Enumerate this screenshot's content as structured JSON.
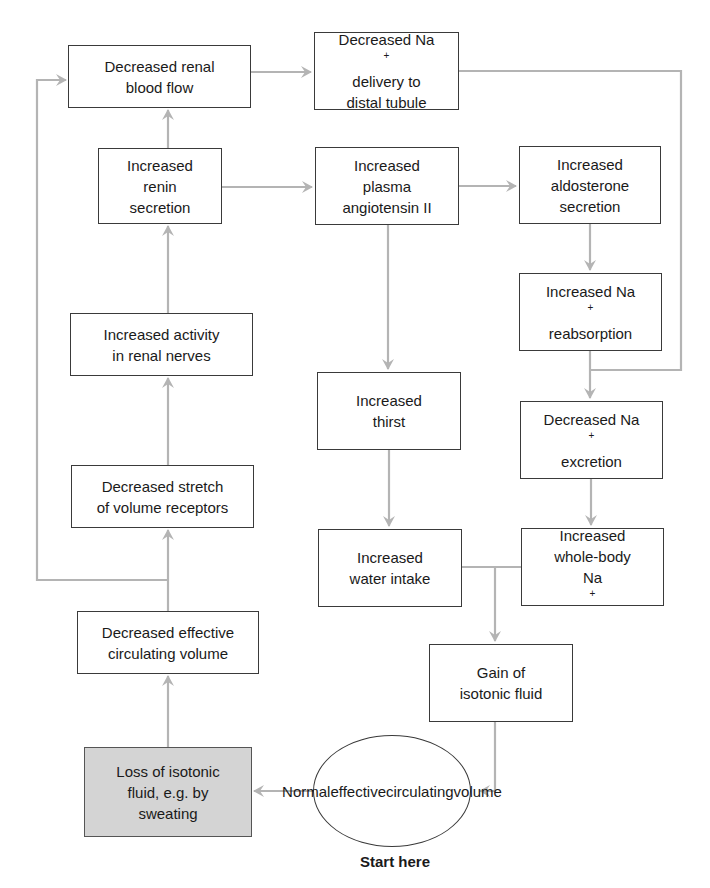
{
  "diagram": {
    "start_label": "Start here",
    "colors": {
      "arrow": "#b4b4b4",
      "border": "#3a3a3a",
      "shaded_box": "#d4d4d4"
    },
    "nodes": {
      "renal_blood_flow": {
        "line1": "Decreased renal",
        "line2": "blood flow"
      },
      "na_delivery": {
        "line1": "Decreased Na",
        "sup1": "+",
        "line2": "delivery to",
        "line3": "distal tubule"
      },
      "renin": {
        "line1": "Increased",
        "line2": "renin",
        "line3": "secretion"
      },
      "angiotensin": {
        "line1": "Increased",
        "line2": "plasma",
        "line3": "angiotensin II"
      },
      "aldosterone": {
        "line1": "Increased",
        "line2": "aldosterone",
        "line3": "secretion"
      },
      "renal_nerves": {
        "line1": "Increased activity",
        "line2": "in renal nerves"
      },
      "na_reabsorption": {
        "line1": "Increased Na",
        "sup1": "+",
        "line2": "reabsorption"
      },
      "thirst": {
        "line1": "Increased",
        "line2": "thirst"
      },
      "na_excretion": {
        "line1": "Decreased Na",
        "sup1": "+",
        "line2": "excretion"
      },
      "volume_receptors": {
        "line1": "Decreased stretch",
        "line2": "of volume receptors"
      },
      "water_intake": {
        "line1": "Increased",
        "line2": "water intake"
      },
      "whole_body_na": {
        "line1": "Increased",
        "line2": "whole-body",
        "line3": "Na",
        "sup3": "+"
      },
      "effective_volume_decreased": {
        "line1": "Decreased effective",
        "line2": "circulating volume"
      },
      "gain_fluid": {
        "line1": "Gain of",
        "line2": "isotonic fluid"
      },
      "loss_fluid": {
        "line1": "Loss of isotonic",
        "line2": "fluid, e.g. by",
        "line3": "sweating"
      },
      "normal_volume": {
        "line1": "Normal",
        "line2": "effective",
        "line3": "circulating",
        "line4": "volume"
      }
    },
    "edges": [
      [
        "normal_volume",
        "loss_fluid"
      ],
      [
        "loss_fluid",
        "effective_volume_decreased"
      ],
      [
        "effective_volume_decreased",
        "volume_receptors"
      ],
      [
        "effective_volume_decreased",
        "renal_blood_flow"
      ],
      [
        "volume_receptors",
        "renal_nerves"
      ],
      [
        "renal_nerves",
        "renin"
      ],
      [
        "renin",
        "renal_blood_flow"
      ],
      [
        "renin",
        "angiotensin"
      ],
      [
        "renal_blood_flow",
        "na_delivery"
      ],
      [
        "angiotensin",
        "aldosterone"
      ],
      [
        "angiotensin",
        "thirst"
      ],
      [
        "aldosterone",
        "na_reabsorption"
      ],
      [
        "na_reabsorption",
        "na_excretion"
      ],
      [
        "na_delivery",
        "na_excretion"
      ],
      [
        "na_excretion",
        "whole_body_na"
      ],
      [
        "thirst",
        "water_intake"
      ],
      [
        "water_intake",
        "gain_fluid"
      ],
      [
        "whole_body_na",
        "gain_fluid"
      ],
      [
        "gain_fluid",
        "normal_volume"
      ]
    ]
  }
}
